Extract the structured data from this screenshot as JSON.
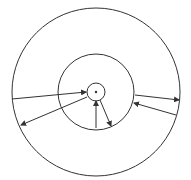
{
  "diagram": {
    "type": "concentric-circles-with-radial-arrows",
    "center": [
      96,
      92
    ],
    "stroke_color": "#333333",
    "background": "#ffffff",
    "circles": [
      {
        "name": "outer",
        "r": 84
      },
      {
        "name": "middle",
        "r": 38
      },
      {
        "name": "inner",
        "r": 9
      }
    ],
    "center_dot": {
      "r": 1.2
    },
    "arrows": [
      {
        "from": [
          12,
          99
        ],
        "to": [
          86,
          92
        ],
        "head": "end"
      },
      {
        "from": [
          87,
          97
        ],
        "to": [
          21,
          125
        ],
        "head": "end"
      },
      {
        "from": [
          96,
          128
        ],
        "to": [
          96,
          101
        ],
        "head": "end"
      },
      {
        "from": [
          100,
          100
        ],
        "to": [
          111,
          126
        ],
        "head": "end"
      },
      {
        "from": [
          135,
          95
        ],
        "to": [
          179,
          100
        ],
        "head": "end"
      },
      {
        "from": [
          176,
          115
        ],
        "to": [
          134,
          103
        ],
        "head": "end"
      }
    ]
  }
}
